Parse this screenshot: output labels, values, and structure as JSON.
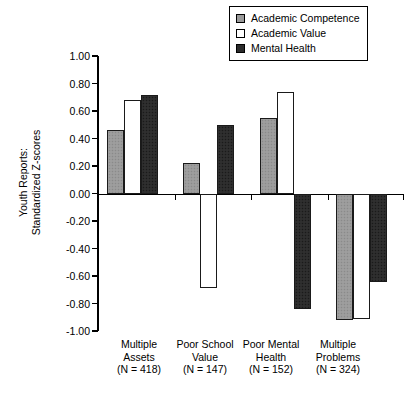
{
  "chart_data": {
    "type": "bar",
    "title": "",
    "xlabel": "",
    "ylabel": "Youth Reports: Standardized Z-scores",
    "ylabel_lines": [
      "Youth Reports:",
      "Standardized Z-scores"
    ],
    "ylim": [
      -1.0,
      1.0
    ],
    "ytick_labels": [
      "1.00",
      "0.80",
      "0.60",
      "0.40",
      "0.20",
      "0.00",
      "-0.20",
      "-0.40",
      "-0.60",
      "-0.80",
      "-1.00"
    ],
    "ytick_values": [
      1.0,
      0.8,
      0.6,
      0.4,
      0.2,
      0.0,
      -0.2,
      -0.4,
      -0.6,
      -0.8,
      -1.0
    ],
    "grid": false,
    "legend_position": "top-right",
    "categories": [
      "Multiple Assets",
      "Poor School Value",
      "Poor Mental Health",
      "Multiple Problems"
    ],
    "category_lines": [
      [
        "Multiple",
        "Assets",
        "(N = 418)"
      ],
      [
        "Poor School",
        "Value",
        "(N = 147)"
      ],
      [
        "Poor Mental",
        "Health",
        "(N = 152)"
      ],
      [
        "Multiple",
        "Problems",
        "(N = 324)"
      ]
    ],
    "series": [
      {
        "name": "Academic Competence",
        "color": "#9a9a9a",
        "values": [
          0.46,
          0.22,
          0.55,
          -0.92
        ]
      },
      {
        "name": "Academic Value",
        "color": "#ffffff",
        "values": [
          0.68,
          -0.69,
          0.74,
          -0.91
        ]
      },
      {
        "name": "Mental Health",
        "color": "#2b2b2b",
        "values": [
          0.72,
          0.5,
          -0.84,
          -0.64
        ]
      }
    ]
  },
  "legend": {
    "items": [
      {
        "label": "Academic Competence",
        "swatch": "gray-square-swatch"
      },
      {
        "label": "Academic Value",
        "swatch": "white-square-swatch"
      },
      {
        "label": "Mental Health",
        "swatch": "black-square-swatch"
      }
    ]
  }
}
